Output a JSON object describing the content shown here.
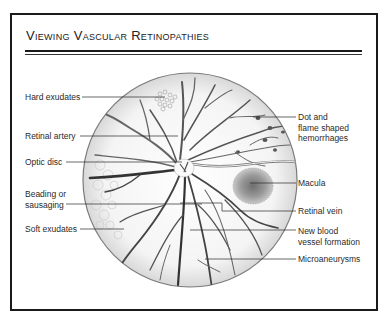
{
  "title": "Viewing Vascular Retinopathies",
  "labels_left": [
    {
      "id": "hard-exudates",
      "text": "Hard exudates"
    },
    {
      "id": "retinal-artery",
      "text": "Retinal artery"
    },
    {
      "id": "optic-disc",
      "text": "Optic disc"
    },
    {
      "id": "beading-or-sausaging",
      "line1": "Beading or",
      "line2": "sausaging"
    },
    {
      "id": "soft-exudates",
      "text": "Soft exudates"
    }
  ],
  "labels_right": [
    {
      "id": "dot-flame-hemorrhages",
      "line1": "Dot and",
      "line2": "flame shaped",
      "line3": "hemorrhages"
    },
    {
      "id": "macula",
      "text": "Macula"
    },
    {
      "id": "retinal-vein",
      "text": "Retinal vein"
    },
    {
      "id": "new-blood-vessel-formation",
      "line1": "New blood",
      "line2": "vessel formation"
    },
    {
      "id": "microaneurysms",
      "text": "Microaneurysms"
    }
  ],
  "colors": {
    "frame": "#1a1a1a",
    "vessel": "#555555",
    "vessel_dark": "#333333",
    "macula": "#8a8a8a",
    "label_text": "#2a2a2a"
  }
}
